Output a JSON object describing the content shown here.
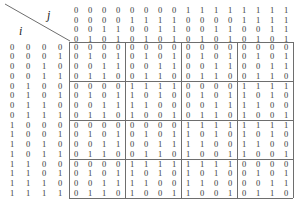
{
  "figure": {
    "row_axis_label": "i",
    "col_axis_label": "j",
    "block_size": 4,
    "line_color": "#6e6e6e",
    "text_color": "#3a3a3a"
  },
  "chart_data": {
    "type": "heatmap",
    "title": "",
    "xlabel": "j",
    "ylabel": "i",
    "grid": true,
    "legend": "none",
    "rows": 16,
    "cols": 16,
    "block_size": 4,
    "col_header_bits": [
      [
        "0",
        "0",
        "0",
        "0",
        "0",
        "0",
        "0",
        "0",
        "1",
        "1",
        "1",
        "1",
        "1",
        "1",
        "1",
        "1"
      ],
      [
        "0",
        "0",
        "0",
        "0",
        "1",
        "1",
        "1",
        "1",
        "0",
        "0",
        "0",
        "0",
        "1",
        "1",
        "1",
        "1"
      ],
      [
        "0",
        "0",
        "1",
        "1",
        "0",
        "0",
        "1",
        "1",
        "0",
        "0",
        "1",
        "1",
        "0",
        "0",
        "1",
        "1"
      ],
      [
        "0",
        "1",
        "0",
        "1",
        "0",
        "1",
        "0",
        "1",
        "0",
        "1",
        "0",
        "1",
        "0",
        "1",
        "0",
        "1"
      ]
    ],
    "row_header_bits": [
      [
        "0",
        "0",
        "0",
        "0"
      ],
      [
        "0",
        "0",
        "0",
        "1"
      ],
      [
        "0",
        "0",
        "1",
        "0"
      ],
      [
        "0",
        "0",
        "1",
        "1"
      ],
      [
        "0",
        "1",
        "0",
        "0"
      ],
      [
        "0",
        "1",
        "0",
        "1"
      ],
      [
        "0",
        "1",
        "1",
        "0"
      ],
      [
        "0",
        "1",
        "1",
        "1"
      ],
      [
        "1",
        "0",
        "0",
        "0"
      ],
      [
        "1",
        "0",
        "0",
        "1"
      ],
      [
        "1",
        "0",
        "1",
        "0"
      ],
      [
        "1",
        "0",
        "1",
        "1"
      ],
      [
        "1",
        "1",
        "0",
        "0"
      ],
      [
        "1",
        "1",
        "0",
        "1"
      ],
      [
        "1",
        "1",
        "1",
        "0"
      ],
      [
        "1",
        "1",
        "1",
        "1"
      ]
    ],
    "values": [
      [
        0,
        0,
        0,
        0,
        0,
        0,
        0,
        0,
        0,
        0,
        0,
        0,
        0,
        0,
        0,
        0
      ],
      [
        0,
        1,
        0,
        1,
        0,
        1,
        0,
        1,
        0,
        1,
        0,
        1,
        0,
        1,
        0,
        1
      ],
      [
        0,
        0,
        1,
        1,
        0,
        0,
        1,
        1,
        0,
        0,
        1,
        1,
        0,
        0,
        1,
        1
      ],
      [
        0,
        1,
        1,
        0,
        0,
        1,
        1,
        0,
        0,
        1,
        1,
        0,
        0,
        1,
        1,
        0
      ],
      [
        0,
        0,
        0,
        0,
        1,
        1,
        1,
        1,
        0,
        0,
        0,
        0,
        1,
        1,
        1,
        1
      ],
      [
        0,
        1,
        0,
        1,
        1,
        0,
        1,
        0,
        0,
        1,
        0,
        1,
        1,
        0,
        1,
        0
      ],
      [
        0,
        0,
        1,
        1,
        1,
        1,
        0,
        0,
        0,
        0,
        1,
        1,
        1,
        1,
        0,
        0
      ],
      [
        0,
        1,
        1,
        0,
        1,
        0,
        0,
        1,
        0,
        1,
        1,
        0,
        1,
        0,
        0,
        1
      ],
      [
        0,
        0,
        0,
        0,
        0,
        0,
        0,
        0,
        1,
        1,
        1,
        1,
        1,
        1,
        1,
        1
      ],
      [
        0,
        1,
        0,
        1,
        0,
        1,
        0,
        1,
        1,
        0,
        1,
        0,
        1,
        0,
        1,
        0
      ],
      [
        0,
        0,
        1,
        1,
        0,
        0,
        1,
        1,
        1,
        1,
        0,
        0,
        1,
        1,
        0,
        0
      ],
      [
        0,
        1,
        1,
        0,
        0,
        1,
        1,
        0,
        1,
        0,
        0,
        1,
        1,
        0,
        0,
        1
      ],
      [
        0,
        0,
        0,
        0,
        1,
        1,
        1,
        1,
        1,
        1,
        1,
        1,
        0,
        0,
        0,
        0
      ],
      [
        0,
        1,
        0,
        1,
        1,
        0,
        1,
        0,
        1,
        0,
        1,
        0,
        0,
        1,
        0,
        1
      ],
      [
        0,
        0,
        1,
        1,
        1,
        1,
        0,
        0,
        1,
        1,
        0,
        0,
        0,
        0,
        1,
        1
      ],
      [
        0,
        1,
        1,
        0,
        1,
        0,
        0,
        1,
        1,
        0,
        0,
        1,
        0,
        1,
        1,
        0
      ]
    ]
  }
}
